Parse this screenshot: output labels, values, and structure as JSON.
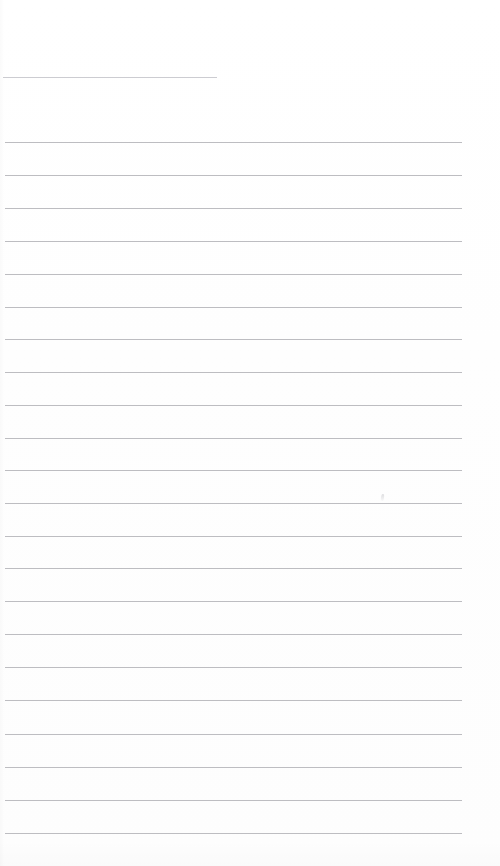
{
  "document": {
    "kind": "lined-paper-scan",
    "title": "Blank lined notebook page",
    "content_text": "",
    "page_width": 500,
    "page_height": 866,
    "background_color": "#ffffff",
    "rule_color": "#b9b9be",
    "header_rule_color": "#c9c9cf",
    "rule_thickness_px": 1,
    "rule_spacing_px": 32.6,
    "total_rule_count": 23
  },
  "header_rule": {
    "name": "header-rule",
    "x": 3,
    "y": 77,
    "width": 214
  },
  "rules": [
    {
      "index": 1,
      "x": 5,
      "y": 142,
      "width": 457
    },
    {
      "index": 2,
      "x": 5,
      "y": 175,
      "width": 457
    },
    {
      "index": 3,
      "x": 5,
      "y": 208,
      "width": 457
    },
    {
      "index": 4,
      "x": 5,
      "y": 241,
      "width": 457
    },
    {
      "index": 5,
      "x": 5,
      "y": 274,
      "width": 457
    },
    {
      "index": 6,
      "x": 5,
      "y": 307,
      "width": 457
    },
    {
      "index": 7,
      "x": 5,
      "y": 339,
      "width": 457
    },
    {
      "index": 8,
      "x": 5,
      "y": 372,
      "width": 457
    },
    {
      "index": 9,
      "x": 5,
      "y": 405,
      "width": 457
    },
    {
      "index": 10,
      "x": 5,
      "y": 438,
      "width": 457
    },
    {
      "index": 11,
      "x": 5,
      "y": 470,
      "width": 457
    },
    {
      "index": 12,
      "x": 5,
      "y": 503,
      "width": 457
    },
    {
      "index": 13,
      "x": 5,
      "y": 536,
      "width": 457
    },
    {
      "index": 14,
      "x": 5,
      "y": 568,
      "width": 457
    },
    {
      "index": 15,
      "x": 5,
      "y": 601,
      "width": 457
    },
    {
      "index": 16,
      "x": 5,
      "y": 634,
      "width": 457
    },
    {
      "index": 17,
      "x": 5,
      "y": 667,
      "width": 457
    },
    {
      "index": 18,
      "x": 5,
      "y": 700,
      "width": 457
    },
    {
      "index": 19,
      "x": 5,
      "y": 734,
      "width": 457
    },
    {
      "index": 20,
      "x": 5,
      "y": 767,
      "width": 457
    },
    {
      "index": 21,
      "x": 5,
      "y": 800,
      "width": 457
    },
    {
      "index": 22,
      "x": 5,
      "y": 833,
      "width": 457
    }
  ],
  "marks": [
    {
      "name": "faint-pencil-mark",
      "x": 381,
      "y": 494
    }
  ]
}
